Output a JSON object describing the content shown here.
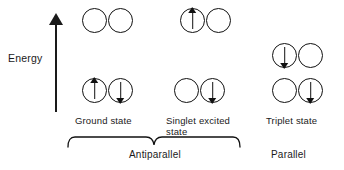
{
  "figure": {
    "axis": {
      "label": "Energy",
      "direction": "up",
      "icon": "up-arrow-icon"
    },
    "states": [
      {
        "id": "ground-state",
        "label": "Ground state",
        "upper_level": [
          "empty",
          "empty"
        ],
        "lower_level": [
          "up",
          "down"
        ],
        "spin_pairing": "Antiparallel"
      },
      {
        "id": "singlet-excited-state",
        "label": "Singlet excited\nstate",
        "upper_level": [
          "up",
          "empty"
        ],
        "lower_level": [
          "empty",
          "down"
        ],
        "spin_pairing": "Antiparallel"
      },
      {
        "id": "triplet-state",
        "label": "Triplet state",
        "upper_level": [
          "down",
          "empty"
        ],
        "lower_level": [
          "empty",
          "down"
        ],
        "spin_pairing": "Parallel"
      }
    ],
    "groups": [
      {
        "id": "antiparallel-group",
        "label": "Antiparallel",
        "has_brace": true
      },
      {
        "id": "parallel-group",
        "label": "Parallel",
        "has_brace": false
      }
    ]
  }
}
